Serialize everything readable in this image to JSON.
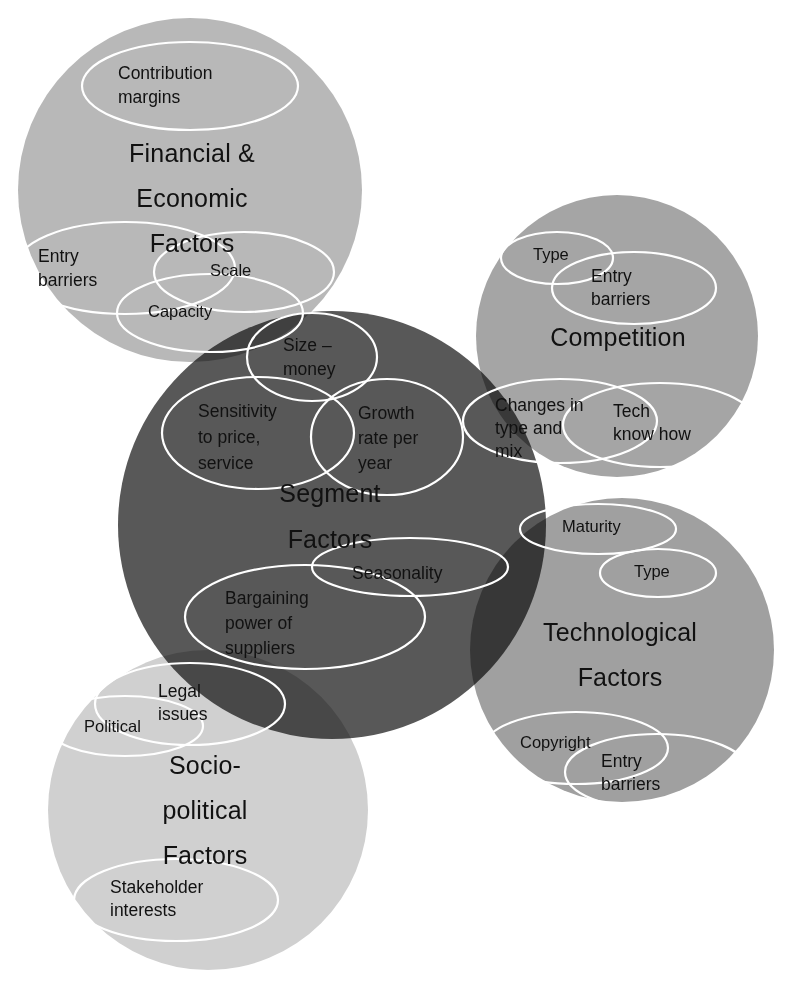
{
  "diagram": {
    "type": "venn-overlap-circles",
    "title_visible": false,
    "background_color": "#ffffff",
    "sub_ellipse_stroke": "#ffffff",
    "text_color": "#111111",
    "main_circles": [
      {
        "id": "financial",
        "label_lines": [
          "Financial &",
          "Economic",
          "Factors"
        ],
        "label": "Financial & Economic Factors",
        "color": "#b8b8b8",
        "cx": 190,
        "cy": 190,
        "r": 172,
        "label_x": 192,
        "label_y_start": 155,
        "label_line_height": 45,
        "sub_items": [
          {
            "id": "contribution-margins",
            "label_lines": [
              "Contribution",
              "margins"
            ],
            "label": "Contribution margins",
            "cx": 190,
            "cy": 86,
            "rx": 108,
            "ry": 44,
            "tx": 118,
            "ty": 74,
            "lh": 24
          },
          {
            "id": "entry-barriers-fin",
            "label_lines": [
              "Entry",
              "barriers"
            ],
            "label": "Entry barriers",
            "cx": 125,
            "cy": 268,
            "rx": 110,
            "ry": 46,
            "tx": 38,
            "ty": 257,
            "lh": 24
          },
          {
            "id": "scale",
            "label_lines": [
              "Scale"
            ],
            "label": "Scale",
            "cx": 244,
            "cy": 272,
            "rx": 90,
            "ry": 40,
            "tx": 210,
            "ty": 272,
            "lh": 24
          },
          {
            "id": "capacity",
            "label_lines": [
              "Capacity"
            ],
            "label": "Capacity",
            "cx": 210,
            "cy": 313,
            "rx": 93,
            "ry": 39,
            "tx": 148,
            "ty": 313,
            "lh": 24
          }
        ]
      },
      {
        "id": "competition",
        "label_lines": [
          "Competition"
        ],
        "label": "Competition",
        "color": "#a5a5a5",
        "cx": 617,
        "cy": 336,
        "r": 141,
        "label_x": 618,
        "label_y_start": 339,
        "label_line_height": 45,
        "sub_items": [
          {
            "id": "type-comp",
            "label_lines": [
              "Type"
            ],
            "label": "Type",
            "cx": 557,
            "cy": 258,
            "rx": 56,
            "ry": 26,
            "tx": 533,
            "ty": 256,
            "lh": 22
          },
          {
            "id": "entry-barriers-comp",
            "label_lines": [
              "Entry",
              "barriers"
            ],
            "label": "Entry barriers",
            "cx": 634,
            "cy": 288,
            "rx": 82,
            "ry": 36,
            "tx": 591,
            "ty": 277,
            "lh": 23
          },
          {
            "id": "changes-in-type-and-mix",
            "label_lines": [
              "Changes in",
              "type and",
              "mix"
            ],
            "label": "Changes in type and mix",
            "cx": 560,
            "cy": 421,
            "rx": 97,
            "ry": 42,
            "tx": 495,
            "ty": 406,
            "lh": 23
          },
          {
            "id": "tech-know-how",
            "label_lines": [
              "Tech",
              "know how"
            ],
            "label": "Tech know how",
            "cx": 660,
            "cy": 425,
            "rx": 97,
            "ry": 42,
            "tx": 613,
            "ty": 412,
            "lh": 23
          }
        ]
      },
      {
        "id": "technological",
        "label_lines": [
          "Technological",
          "Factors"
        ],
        "label": "Technological Factors",
        "color": "#a0a0a0",
        "cx": 622,
        "cy": 650,
        "r": 152,
        "label_x": 620,
        "label_y_start": 634,
        "label_line_height": 45,
        "sub_items": [
          {
            "id": "maturity",
            "label_lines": [
              "Maturity"
            ],
            "label": "Maturity",
            "cx": 598,
            "cy": 529,
            "rx": 78,
            "ry": 25,
            "tx": 562,
            "ty": 528,
            "lh": 22
          },
          {
            "id": "type-tech",
            "label_lines": [
              "Type"
            ],
            "label": "Type",
            "cx": 658,
            "cy": 573,
            "rx": 58,
            "ry": 24,
            "tx": 634,
            "ty": 573,
            "lh": 22
          },
          {
            "id": "copyright",
            "label_lines": [
              "Copyright"
            ],
            "label": "Copyright",
            "cx": 576,
            "cy": 748,
            "rx": 92,
            "ry": 36,
            "tx": 520,
            "ty": 744,
            "lh": 22
          },
          {
            "id": "entry-barriers-tech",
            "label_lines": [
              "Entry",
              "barriers"
            ],
            "label": "Entry barriers",
            "cx": 657,
            "cy": 772,
            "rx": 92,
            "ry": 38,
            "tx": 601,
            "ty": 762,
            "lh": 23
          }
        ]
      },
      {
        "id": "segment",
        "label_lines": [
          "Segment",
          "Factors"
        ],
        "label": "Segment Factors",
        "color": "#585858",
        "cx": 332,
        "cy": 525,
        "r": 214,
        "label_x": 330,
        "label_y_start": 495,
        "label_line_height": 46,
        "sub_items": [
          {
            "id": "size-money",
            "label_lines": [
              "Size –",
              "money"
            ],
            "label": "Size – money",
            "cx": 312,
            "cy": 357,
            "rx": 65,
            "ry": 44,
            "tx": 283,
            "ty": 346,
            "lh": 24
          },
          {
            "id": "sensitivity-to-price-service",
            "label_lines": [
              "Sensitivity",
              "to price,",
              "service"
            ],
            "label": "Sensitivity to price, service",
            "cx": 258,
            "cy": 433,
            "rx": 96,
            "ry": 56,
            "tx": 198,
            "ty": 412,
            "lh": 26
          },
          {
            "id": "growth-rate-per-year",
            "label_lines": [
              "Growth",
              "rate per",
              "year"
            ],
            "label": "Growth rate per year",
            "cx": 387,
            "cy": 437,
            "rx": 76,
            "ry": 58,
            "tx": 358,
            "ty": 414,
            "lh": 25
          },
          {
            "id": "seasonality",
            "label_lines": [
              "Seasonality"
            ],
            "label": "Seasonality",
            "cx": 410,
            "cy": 567,
            "rx": 98,
            "ry": 29,
            "tx": 352,
            "ty": 574,
            "lh": 22
          },
          {
            "id": "bargaining-power-of-suppliers",
            "label_lines": [
              "Bargaining",
              "power of",
              "suppliers"
            ],
            "label": "Bargaining power of suppliers",
            "cx": 305,
            "cy": 617,
            "rx": 120,
            "ry": 52,
            "tx": 225,
            "ty": 599,
            "lh": 25
          }
        ]
      },
      {
        "id": "socio-political",
        "label_lines": [
          "Socio-",
          "political",
          "Factors"
        ],
        "label": "Socio-political Factors",
        "color": "#d0d0d0",
        "cx": 208,
        "cy": 810,
        "r": 160,
        "label_x": 205,
        "label_y_start": 767,
        "label_line_height": 45,
        "sub_items": [
          {
            "id": "legal-issues",
            "label_lines": [
              "Legal",
              "issues"
            ],
            "label": "Legal issues",
            "cx": 190,
            "cy": 704,
            "rx": 95,
            "ry": 41,
            "tx": 158,
            "ty": 692,
            "lh": 23
          },
          {
            "id": "political",
            "label_lines": [
              "Political"
            ],
            "label": "Political",
            "cx": 125,
            "cy": 726,
            "rx": 78,
            "ry": 30,
            "tx": 84,
            "ty": 728,
            "lh": 22
          },
          {
            "id": "stakeholder-interests",
            "label_lines": [
              "Stakeholder",
              "interests"
            ],
            "label": "Stakeholder interests",
            "cx": 176,
            "cy": 900,
            "rx": 102,
            "ry": 41,
            "tx": 110,
            "ty": 888,
            "lh": 23
          }
        ]
      }
    ]
  }
}
